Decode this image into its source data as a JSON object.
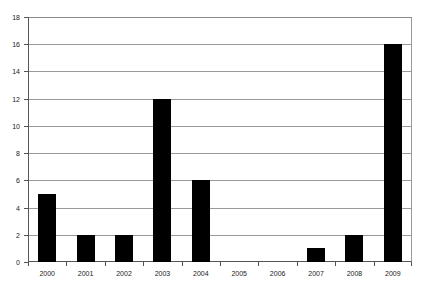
{
  "chart_data": {
    "type": "bar",
    "title": "",
    "subtitle": "",
    "xlabel": "",
    "ylabel": "",
    "categories": [
      "2000",
      "2001",
      "2002",
      "2003",
      "2004",
      "2005",
      "2006",
      "2007",
      "2008",
      "2009"
    ],
    "values": [
      5,
      2,
      2,
      12,
      6,
      0,
      0,
      1,
      2,
      16
    ],
    "ylim": [
      0,
      18
    ],
    "ytick_step": 2,
    "yticks": [
      18,
      16,
      14,
      12,
      10,
      8,
      6,
      4,
      2,
      0
    ],
    "ytick_labels": [
      "18",
      "16",
      "14",
      "12",
      "10",
      "8",
      "6",
      "4",
      "2",
      "0"
    ],
    "grid": true,
    "grid_axis": "y",
    "legend": false,
    "legend_position": "none",
    "bar_color": "#000000",
    "grid_color": "#9a9a9a",
    "axis_color": "#555555",
    "background_color": "#ffffff",
    "series": [
      {
        "name": "values",
        "values": [
          5,
          2,
          2,
          12,
          6,
          0,
          0,
          1,
          2,
          16
        ]
      }
    ],
    "points": [
      {
        "category": "2000",
        "value": 5
      },
      {
        "category": "2001",
        "value": 2
      },
      {
        "category": "2002",
        "value": 2
      },
      {
        "category": "2003",
        "value": 12
      },
      {
        "category": "2004",
        "value": 6
      },
      {
        "category": "2005",
        "value": 0
      },
      {
        "category": "2006",
        "value": 0
      },
      {
        "category": "2007",
        "value": 1
      },
      {
        "category": "2008",
        "value": 2
      },
      {
        "category": "2009",
        "value": 16
      }
    ]
  }
}
